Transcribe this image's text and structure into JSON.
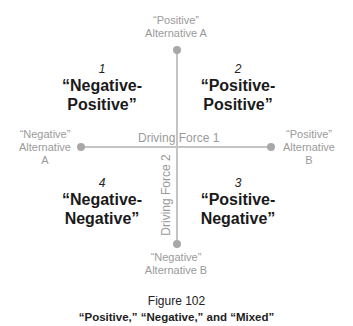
{
  "axes": {
    "vertical": {
      "label": "Driving Force 2",
      "top_end": {
        "line1": "“Positive”",
        "line2": "Alternative A"
      },
      "bottom_end": {
        "line1": "“Negative”",
        "line2": "Alternative B"
      }
    },
    "horizontal": {
      "label": "Driving Force 1",
      "left_end": {
        "line1": "“Negative”",
        "line2": "Alternative",
        "line3": "A"
      },
      "right_end": {
        "line1": "“Positive”",
        "line2": "Alternative",
        "line3": "B"
      }
    }
  },
  "quadrants": [
    {
      "number": "1",
      "line1": "“Negative-",
      "line2": "Positive”"
    },
    {
      "number": "2",
      "line1": "“Positive-",
      "line2": "Positive”"
    },
    {
      "number": "3",
      "line1": "“Positive-",
      "line2": "Negative”"
    },
    {
      "number": "4",
      "line1": "“Negative-",
      "line2": "Negative”"
    }
  ],
  "caption": {
    "figure": "Figure 102",
    "title": "“Positive,” “Negative,” and “Mixed”"
  },
  "colors": {
    "axis": "#c4c4c4",
    "dot": "#a8a8a8",
    "label": "#9a9a9a",
    "title": "#1a1a1a"
  }
}
